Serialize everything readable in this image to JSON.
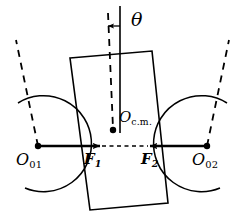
{
  "figure": {
    "kind": "free-body-diagram",
    "width": 241,
    "height": 224,
    "background_color": "#ffffff",
    "stroke_color": "#000000"
  },
  "labels": {
    "theta": "θ",
    "center_of_mass": "O",
    "center_of_mass_sub": "c.m.",
    "pivot_left": "O",
    "pivot_left_sub": "01",
    "pivot_right": "O",
    "pivot_right_sub": "02",
    "force_left": "F",
    "force_left_sub": "1",
    "force_right": "F",
    "force_right_sub": "2"
  },
  "geometry": {
    "block": {
      "top_left": [
        70,
        58
      ],
      "top_right": [
        152,
        51
      ],
      "bottom_right": [
        168,
        203
      ],
      "bottom_left": [
        90,
        210
      ],
      "tilt_degrees": 6
    },
    "vertical_reference_line": {
      "x": 120,
      "y_top": 6,
      "y_bottom": 133
    },
    "tilted_dashed_axis": {
      "x_top": 108,
      "y_top": 14,
      "x_bottom": 113,
      "y_bottom": 130
    },
    "center_of_mass_point": [
      113,
      130
    ],
    "pivot_left_point": [
      38,
      146
    ],
    "pivot_right_point": [
      207,
      146
    ],
    "force_left_arrow": {
      "from": [
        38,
        146
      ],
      "to": [
        104,
        146
      ]
    },
    "force_right_arrow": {
      "from": [
        207,
        146
      ],
      "to": [
        146,
        146
      ]
    },
    "contact_dashed_segment": {
      "from": [
        104,
        146
      ],
      "to": [
        146,
        146
      ]
    },
    "arc_left": {
      "center": [
        38,
        146
      ],
      "radius": 48
    },
    "arc_right": {
      "center": [
        207,
        146
      ],
      "radius": 48
    },
    "dashed_radius_left": {
      "from": [
        38,
        146
      ],
      "to": [
        17,
        42
      ]
    },
    "dashed_radius_right": {
      "from": [
        207,
        146
      ],
      "to": [
        228,
        42
      ]
    },
    "theta_tick_arrow": {
      "from": [
        120,
        26
      ],
      "to": [
        107,
        26
      ]
    }
  },
  "colors": {
    "stroke": "#000000",
    "background": "#ffffff"
  }
}
